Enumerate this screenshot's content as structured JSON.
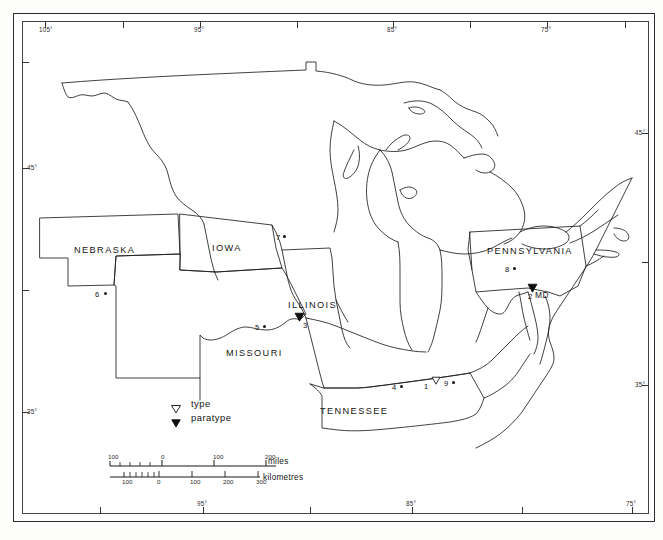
{
  "figure": {
    "type": "distribution-map",
    "region": "Central and Eastern United States",
    "caption": ""
  },
  "graticule": {
    "top_labels": [
      {
        "text": "105°",
        "x": 45
      },
      {
        "text": "95°",
        "x": 200
      },
      {
        "text": "85°",
        "x": 393
      },
      {
        "text": "75°",
        "x": 547
      }
    ],
    "top_ticks_x": [
      45,
      123,
      200,
      297,
      393,
      470,
      547,
      625
    ],
    "bottom_labels": [
      {
        "text": "95°",
        "x": 203
      },
      {
        "text": "85°",
        "x": 412
      },
      {
        "text": "75°",
        "x": 632
      }
    ],
    "bottom_ticks_x": [
      100,
      203,
      310,
      412,
      522,
      632
    ],
    "left_labels": [
      {
        "text": "45°",
        "y": 168
      },
      {
        "text": "35°",
        "y": 412
      }
    ],
    "left_ticks_y": [
      62,
      168,
      290,
      412
    ],
    "right_labels": [
      {
        "text": "45°",
        "y": 133
      },
      {
        "text": "35°",
        "y": 385
      }
    ],
    "right_ticks_y": [
      133,
      262,
      385
    ]
  },
  "states": [
    {
      "name": "NEBRASKA",
      "x": 74,
      "y": 245
    },
    {
      "name": "IOWA",
      "x": 212,
      "y": 243
    },
    {
      "name": "ILLINOIS",
      "x": 288,
      "y": 300
    },
    {
      "name": "MISSOURI",
      "x": 226,
      "y": 348
    },
    {
      "name": "TENNESSEE",
      "x": 320,
      "y": 406
    },
    {
      "name": "PENNSYLVANIA",
      "x": 487,
      "y": 246
    }
  ],
  "abbreviations": [
    {
      "name": "MD",
      "x": 535,
      "y": 290
    }
  ],
  "localities": [
    {
      "id": "1",
      "symbol": "type",
      "num_x": 424,
      "num_y": 383,
      "sym_x": 431,
      "sym_y": 376
    },
    {
      "id": "2",
      "symbol": "paratype",
      "num_x": 528,
      "num_y": 293,
      "sym_x": 527,
      "sym_y": 283
    },
    {
      "id": "3",
      "symbol": "paratype",
      "num_x": 303,
      "num_y": 322,
      "sym_x": 294,
      "sym_y": 312
    },
    {
      "id": "4",
      "symbol": "record",
      "num_x": 392,
      "num_y": 384,
      "sym_x": 400,
      "sym_y": 385
    },
    {
      "id": "5",
      "symbol": "record",
      "num_x": 255,
      "num_y": 324,
      "sym_x": 263,
      "sym_y": 325
    },
    {
      "id": "6",
      "symbol": "record",
      "num_x": 95,
      "num_y": 291,
      "sym_x": 104,
      "sym_y": 292
    },
    {
      "id": "7",
      "symbol": "record",
      "num_x": 276,
      "num_y": 234,
      "sym_x": 283,
      "sym_y": 235
    },
    {
      "id": "8",
      "symbol": "record",
      "num_x": 505,
      "num_y": 266,
      "sym_x": 513,
      "sym_y": 267
    },
    {
      "id": "9",
      "symbol": "record",
      "num_x": 444,
      "num_y": 380,
      "sym_x": 452,
      "sym_y": 381
    }
  ],
  "legend": {
    "items": [
      {
        "symbol": "open-triangle-down",
        "label": "type"
      },
      {
        "symbol": "solid-triangle-down",
        "label": "paratype"
      }
    ]
  },
  "scale": {
    "miles": {
      "unit_label": "miles",
      "ticks": [
        {
          "value": "100",
          "px": 8
        },
        {
          "value": "0",
          "px": 61
        },
        {
          "value": "100",
          "px": 113
        },
        {
          "value": "200",
          "px": 165
        }
      ]
    },
    "kilometres": {
      "unit_label": "kilometres",
      "ticks": [
        {
          "value": "100",
          "px": 22
        },
        {
          "value": "0",
          "px": 57
        },
        {
          "value": "100",
          "px": 90
        },
        {
          "value": "200",
          "px": 123
        },
        {
          "value": "300",
          "px": 156
        }
      ]
    }
  },
  "colors": {
    "ink": "#1f1f1f",
    "paper": "#ffffff",
    "page": "#fdfdfc",
    "frame": "#2b2b2b"
  }
}
